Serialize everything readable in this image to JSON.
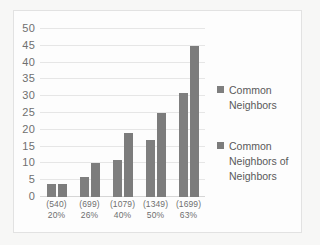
{
  "chart_data": {
    "type": "bar",
    "title": "",
    "xlabel": "",
    "ylabel": "",
    "ylim": [
      0,
      50
    ],
    "ytick_step": 5,
    "yticks": [
      50,
      45,
      40,
      35,
      30,
      25,
      20,
      15,
      10,
      5,
      0
    ],
    "grid": true,
    "legend_position": "right",
    "categories": [
      "(540)\n20%",
      "(699)\n26%",
      "(1079)\n40%",
      "(1349)\n50%",
      "(1699)\n63%"
    ],
    "category_lines": [
      {
        "count": "(540)",
        "percent": "20%"
      },
      {
        "count": "(699)",
        "percent": "26%"
      },
      {
        "count": "(1079)",
        "percent": "40%"
      },
      {
        "count": "(1349)",
        "percent": "50%"
      },
      {
        "count": "(1699)",
        "percent": "63%"
      }
    ],
    "series": [
      {
        "name": "Common Neighbors",
        "color": "#7f7f7f",
        "values": [
          4,
          6,
          11,
          17,
          31
        ]
      },
      {
        "name": "Common Neighbors of Neighbors",
        "color": "#7c7c7c",
        "values": [
          4,
          10,
          19,
          25,
          45
        ]
      }
    ]
  },
  "legend": {
    "entries": [
      {
        "label_line1": "Common",
        "label_line2": "Neighbors",
        "label_line3": ""
      },
      {
        "label_line1": "Common",
        "label_line2": "Neighbors of",
        "label_line3": "Neighbors"
      }
    ]
  },
  "colors": {
    "page_background": "#f7f7f6",
    "chart_background": "#fdfdfd",
    "border": "#e2e2e2",
    "gridline": "#e6e6e6",
    "bar": "#7f7f7f",
    "text": "#6f6f6f"
  }
}
